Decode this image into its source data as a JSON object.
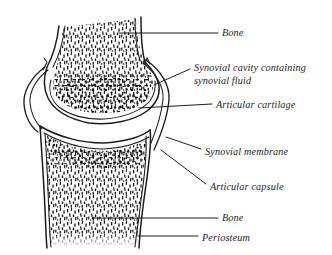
{
  "diagram": {
    "ink_color": "#1c1c1c",
    "background_color": "#ffffff",
    "labels": {
      "bone_top": "Bone",
      "synovial_cavity_line1": "Synovial cavity containing",
      "synovial_cavity_line2": "synovial fluid",
      "articular_cartilage": "Articular cartilage",
      "synovial_membrane": "Synovial membrane",
      "articular_capsule": "Articular capsule",
      "bone_bottom": "Bone",
      "periosteum": "Periosteum"
    }
  }
}
